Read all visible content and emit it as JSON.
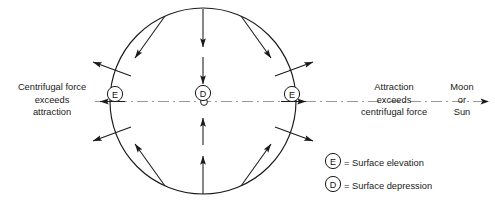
{
  "diagram": {
    "title": "",
    "body_circle": {
      "center_x": 203,
      "center_y": 101,
      "radius": 93,
      "stroke": "#1a1a1a"
    },
    "axis": {
      "style": "dash-dot",
      "y": 101,
      "x_start": 95,
      "x_end": 490,
      "color": "#8a8a8a",
      "arrow_left_label": "left-arrowhead",
      "arrow_right_label": "right-arrowhead"
    },
    "markers": {
      "center_point": "open-circle",
      "depression_letter": "D",
      "elevation_letter": "E",
      "elevation_left_x": 115,
      "elevation_right_x": 292,
      "depression_x": 203,
      "depression_y": 93
    },
    "labels": {
      "left": {
        "line1": "Centrifugal force",
        "line2": "exceeds",
        "line3": "attraction"
      },
      "right": {
        "line1": "Attraction",
        "line2": "exceeds",
        "line3": "centrifugal force"
      },
      "body": {
        "line1": "Moon",
        "line2": "or",
        "line3": "Sun"
      }
    },
    "legend": {
      "items": [
        {
          "symbol": "E",
          "equals": "= Surface elevation"
        },
        {
          "symbol": "D",
          "equals": "= Surface depression"
        }
      ]
    },
    "colors": {
      "ink": "#1a1a1a",
      "axis": "#8a8a8a",
      "background": "#ffffff"
    }
  }
}
